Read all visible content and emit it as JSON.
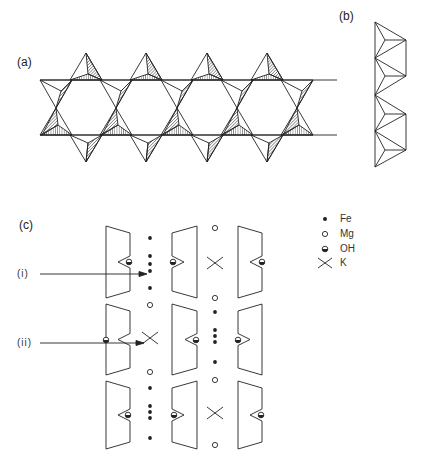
{
  "panels": {
    "a": {
      "label": "(a)",
      "description": "Double-chain of corner-sharing tetrahedra forming hexagonal rings (plan view)"
    },
    "b": {
      "label": "(b)",
      "description": "Side view of tetrahedral chain"
    },
    "c": {
      "label": "(c)",
      "description": "Cross-section of layered structure showing cation sites between tetrahedral sheets"
    }
  },
  "annotations": {
    "i": "(i)",
    "ii": "(ii)"
  },
  "legend": {
    "items": [
      {
        "symbol": "filled-circle",
        "label": "Fe"
      },
      {
        "symbol": "open-circle",
        "label": "Mg"
      },
      {
        "symbol": "half-filled-circle",
        "label": "OH"
      },
      {
        "symbol": "cross",
        "label": "K"
      }
    ]
  }
}
